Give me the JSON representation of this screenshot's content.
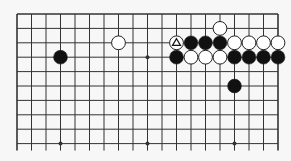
{
  "diagram": {
    "type": "go-board-partial",
    "colors": {
      "background": "#f7f7f7",
      "line": "#333333",
      "black_stone": "#111111",
      "white_stone": "#ffffff",
      "stone_outline": "#222222"
    },
    "grid": {
      "columns": 19,
      "rows": 10,
      "origin_x": 17,
      "origin_y": 14,
      "spacing_x": 14.5,
      "spacing_y": 14.4,
      "top_edge": true,
      "left_edge": true,
      "right_edge": true,
      "bottom_edge": false
    },
    "star_points": [
      {
        "col": 9,
        "row": 3
      },
      {
        "col": 3,
        "row": 9
      },
      {
        "col": 9,
        "row": 9
      },
      {
        "col": 15,
        "row": 9
      }
    ],
    "stones": [
      {
        "color": "black",
        "col": 3,
        "row": 3
      },
      {
        "color": "white",
        "col": 7,
        "row": 2
      },
      {
        "color": "white",
        "col": 14,
        "row": 1
      },
      {
        "color": "white",
        "col": 11,
        "row": 2,
        "marker": "triangle"
      },
      {
        "color": "black",
        "col": 12,
        "row": 2
      },
      {
        "color": "black",
        "col": 13,
        "row": 2
      },
      {
        "color": "black",
        "col": 14,
        "row": 2
      },
      {
        "color": "white",
        "col": 15,
        "row": 2
      },
      {
        "color": "white",
        "col": 16,
        "row": 2
      },
      {
        "color": "white",
        "col": 17,
        "row": 2
      },
      {
        "color": "white",
        "col": 18,
        "row": 2
      },
      {
        "color": "black",
        "col": 11,
        "row": 3
      },
      {
        "color": "white",
        "col": 12,
        "row": 3
      },
      {
        "color": "white",
        "col": 13,
        "row": 3
      },
      {
        "color": "white",
        "col": 14,
        "row": 3
      },
      {
        "color": "black",
        "col": 15,
        "row": 3
      },
      {
        "color": "black",
        "col": 16,
        "row": 3
      },
      {
        "color": "black",
        "col": 17,
        "row": 3
      },
      {
        "color": "black",
        "col": 18,
        "row": 3
      },
      {
        "color": "black",
        "col": 15,
        "row": 5
      }
    ]
  }
}
